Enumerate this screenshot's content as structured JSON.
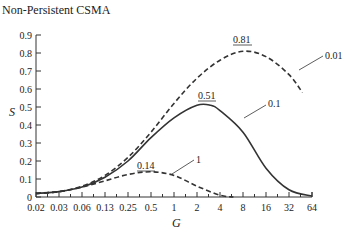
{
  "chart_data": {
    "type": "line",
    "title": "Non-Persistent CSMA",
    "xlabel": "G",
    "ylabel": "S",
    "x_scale": "log2",
    "x_ticks": [
      "0.02",
      "0.03",
      "0.06",
      "0.13",
      "0.25",
      "0.5",
      "1",
      "2",
      "4",
      "8",
      "16",
      "32",
      "64"
    ],
    "y_ticks": [
      "0",
      "0.1",
      "0.2",
      "0.3",
      "0.4",
      "0.5",
      "0.6",
      "0.7",
      "0.8",
      "0.9"
    ],
    "ylim": [
      0,
      0.9
    ],
    "grid": false,
    "series": [
      {
        "name": "0.01",
        "style": "dashed",
        "peak_label": "0.81",
        "points": [
          [
            0.02,
            0.02
          ],
          [
            0.03,
            0.03
          ],
          [
            0.06,
            0.06
          ],
          [
            0.13,
            0.12
          ],
          [
            0.25,
            0.22
          ],
          [
            0.5,
            0.36
          ],
          [
            1,
            0.52
          ],
          [
            2,
            0.66
          ],
          [
            4,
            0.76
          ],
          [
            8,
            0.81
          ],
          [
            16,
            0.78
          ],
          [
            32,
            0.68
          ],
          [
            48,
            0.58
          ]
        ]
      },
      {
        "name": "0.1",
        "style": "solid",
        "peak_label": "0.51",
        "points": [
          [
            0.02,
            0.02
          ],
          [
            0.03,
            0.03
          ],
          [
            0.06,
            0.055
          ],
          [
            0.13,
            0.11
          ],
          [
            0.25,
            0.2
          ],
          [
            0.5,
            0.33
          ],
          [
            1,
            0.44
          ],
          [
            2,
            0.51
          ],
          [
            3,
            0.51
          ],
          [
            4,
            0.48
          ],
          [
            8,
            0.36
          ],
          [
            16,
            0.16
          ],
          [
            32,
            0.04
          ],
          [
            64,
            0.005
          ]
        ]
      },
      {
        "name": "1",
        "style": "dashed",
        "peak_label": "0.14",
        "points": [
          [
            0.02,
            0.02
          ],
          [
            0.03,
            0.03
          ],
          [
            0.06,
            0.055
          ],
          [
            0.13,
            0.09
          ],
          [
            0.25,
            0.125
          ],
          [
            0.5,
            0.14
          ],
          [
            1,
            0.12
          ],
          [
            2,
            0.06
          ],
          [
            4,
            0.01
          ],
          [
            6,
            0.0
          ]
        ]
      }
    ]
  },
  "labels": {
    "title": "Non-Persistent CSMA",
    "ylabel": "S",
    "xlabel": "G",
    "peak_001": "0.81",
    "peak_01": "0.51",
    "peak_1": "0.14",
    "curve_001": "0.01",
    "curve_01": "0.1",
    "curve_1": "1"
  }
}
